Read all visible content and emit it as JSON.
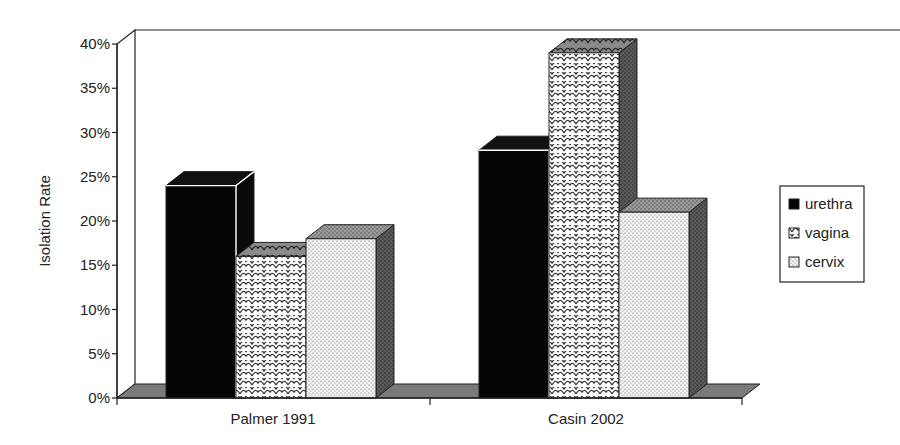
{
  "chart_data": {
    "type": "bar",
    "style": "3d-clustered-column",
    "title": "",
    "xlabel": "",
    "ylabel": "Isolation Rate",
    "ylim": [
      0,
      40
    ],
    "yticks": [
      "0%",
      "5%",
      "10%",
      "15%",
      "20%",
      "25%",
      "30%",
      "35%",
      "40%"
    ],
    "categories": [
      "Palmer 1991",
      "Casin 2002"
    ],
    "series": [
      {
        "name": "urethra",
        "values": [
          24,
          28
        ],
        "pattern": "solid-black"
      },
      {
        "name": "vagina",
        "values": [
          16,
          39
        ],
        "pattern": "scale-crosshatch"
      },
      {
        "name": "cervix",
        "values": [
          18,
          21
        ],
        "pattern": "fine-dots"
      }
    ],
    "legend_position": "right",
    "grid": false
  },
  "axis": {
    "ylabel": "Isolation Rate"
  },
  "legend": {
    "items": [
      "urethra",
      "vagina",
      "cervix"
    ]
  }
}
